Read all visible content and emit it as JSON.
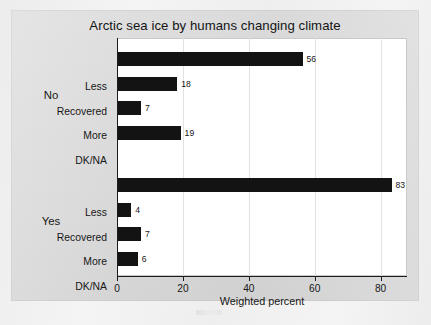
{
  "chart_data": {
    "type": "bar",
    "orientation": "horizontal",
    "title": "Arctic sea ice by humans changing climate",
    "xlabel": "Weighted percent",
    "ylabel": "",
    "xlim": [
      0,
      88
    ],
    "xticks": [
      0,
      20,
      40,
      60,
      80
    ],
    "xtick_labels": [
      "0",
      "20",
      "40",
      "60",
      "80"
    ],
    "grid": "vertical",
    "legend": "none",
    "groups": [
      {
        "name": "No",
        "categories": [
          "Less",
          "Recovered",
          "More",
          "DK/NA"
        ],
        "values": [
          56,
          18,
          7,
          19
        ],
        "value_labels": [
          "56",
          "18",
          "7",
          "19"
        ]
      },
      {
        "name": "Yes",
        "categories": [
          "Less",
          "Recovered",
          "More",
          "DK/NA"
        ],
        "values": [
          83,
          4,
          7,
          6
        ],
        "value_labels": [
          "83",
          "4",
          "7",
          "6"
        ]
      }
    ],
    "bar_color": "#131313",
    "plot_background": "#ffffff",
    "figure_background": "#d9d9d9"
  }
}
